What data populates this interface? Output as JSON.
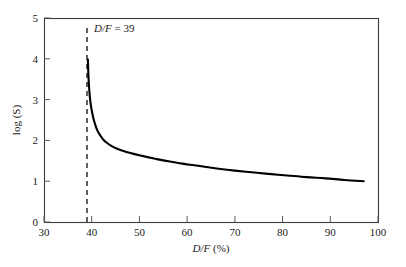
{
  "chart_data": {
    "type": "line",
    "title": "",
    "xlabel": "D/F (%)",
    "ylabel": "log (S)",
    "xlim": [
      30,
      100
    ],
    "ylim": [
      0,
      5
    ],
    "grid": false,
    "legend": null,
    "xticks": [
      "30",
      "40",
      "50",
      "60",
      "70",
      "80",
      "90",
      "100"
    ],
    "xtick_values": [
      30,
      40,
      50,
      60,
      70,
      80,
      90,
      100
    ],
    "yticks": [
      "0",
      "1",
      "2",
      "3",
      "4",
      "5"
    ],
    "ytick_values": [
      0,
      1,
      2,
      3,
      4,
      5
    ],
    "annotations": [
      {
        "name": "asymptote-label",
        "text_italic": "D/F",
        "text_rest": " = 39",
        "text": "D/F = 39",
        "x": 39,
        "y": 4.55
      }
    ],
    "reference_lines": [
      {
        "name": "vertical-asymptote",
        "orientation": "vertical",
        "value": 39,
        "style": "dashed"
      }
    ],
    "series": [
      {
        "name": "log(S) vs D/F",
        "x": [
          39.2,
          39.3,
          39.45,
          39.6,
          39.8,
          40.0,
          40.3,
          40.7,
          41.2,
          41.8,
          42.5,
          43.3,
          44.2,
          45.2,
          46.3,
          47.5,
          48.8,
          50.2,
          51.7,
          53.3,
          55.0,
          57.0,
          59.0,
          61.5,
          64.0,
          67.0,
          70.0,
          73.5,
          77.0,
          81.0,
          85.0,
          89.0,
          93.0,
          97.0
        ],
        "y": [
          3.98,
          3.62,
          3.3,
          3.08,
          2.88,
          2.74,
          2.57,
          2.4,
          2.24,
          2.12,
          2.01,
          1.93,
          1.86,
          1.8,
          1.75,
          1.71,
          1.67,
          1.63,
          1.59,
          1.55,
          1.51,
          1.47,
          1.43,
          1.39,
          1.35,
          1.3,
          1.26,
          1.22,
          1.18,
          1.14,
          1.1,
          1.07,
          1.03,
          1.0
        ]
      }
    ]
  },
  "axes": {
    "x_label": "D/F (%)",
    "x_label_italic": "D/F",
    "x_label_rest": " (%)",
    "y_label": "log (S)"
  }
}
